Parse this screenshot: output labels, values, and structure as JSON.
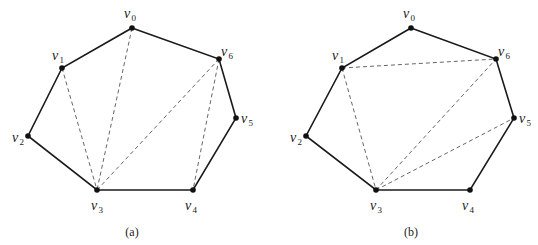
{
  "figures": [
    {
      "caption": "(a)",
      "vertices": [
        {
          "name": "v0",
          "label": "v",
          "sub": "0",
          "x": 132,
          "y": 28,
          "lx": -8,
          "ly": -10
        },
        {
          "name": "v1",
          "label": "v",
          "sub": "1",
          "x": 62,
          "y": 68,
          "lx": -10,
          "ly": -8
        },
        {
          "name": "v2",
          "label": "v",
          "sub": "2",
          "x": 28,
          "y": 136,
          "lx": -16,
          "ly": 6
        },
        {
          "name": "v3",
          "label": "v",
          "sub": "3",
          "x": 97,
          "y": 190,
          "lx": -6,
          "ly": 20
        },
        {
          "name": "v4",
          "label": "v",
          "sub": "4",
          "x": 193,
          "y": 190,
          "lx": -8,
          "ly": 20
        },
        {
          "name": "v5",
          "label": "v",
          "sub": "5",
          "x": 236,
          "y": 118,
          "lx": 5,
          "ly": 5
        },
        {
          "name": "v6",
          "label": "v",
          "sub": "6",
          "x": 219,
          "y": 59,
          "lx": 2,
          "ly": -3
        }
      ],
      "polygon": [
        "v0",
        "v6",
        "v5",
        "v4",
        "v3",
        "v2",
        "v1"
      ],
      "diagonals": [
        [
          "v1",
          "v3"
        ],
        [
          "v0",
          "v3"
        ],
        [
          "v6",
          "v3"
        ],
        [
          "v6",
          "v4"
        ]
      ],
      "caption_pos": {
        "x": 132,
        "y": 236
      }
    },
    {
      "caption": "(b)",
      "vertices": [
        {
          "name": "v0",
          "label": "v",
          "sub": "0",
          "x": 411,
          "y": 28,
          "lx": -8,
          "ly": -10
        },
        {
          "name": "v1",
          "label": "v",
          "sub": "1",
          "x": 342,
          "y": 68,
          "lx": -10,
          "ly": -8
        },
        {
          "name": "v2",
          "label": "v",
          "sub": "2",
          "x": 306,
          "y": 136,
          "lx": -16,
          "ly": 6
        },
        {
          "name": "v3",
          "label": "v",
          "sub": "3",
          "x": 376,
          "y": 190,
          "lx": -6,
          "ly": 20
        },
        {
          "name": "v4",
          "label": "v",
          "sub": "4",
          "x": 470,
          "y": 190,
          "lx": -8,
          "ly": 20
        },
        {
          "name": "v5",
          "label": "v",
          "sub": "5",
          "x": 514,
          "y": 118,
          "lx": 5,
          "ly": 5
        },
        {
          "name": "v6",
          "label": "v",
          "sub": "6",
          "x": 496,
          "y": 59,
          "lx": 2,
          "ly": -3
        }
      ],
      "polygon": [
        "v0",
        "v6",
        "v5",
        "v4",
        "v3",
        "v2",
        "v1"
      ],
      "diagonals": [
        [
          "v1",
          "v6"
        ],
        [
          "v1",
          "v3"
        ],
        [
          "v3",
          "v6"
        ],
        [
          "v3",
          "v5"
        ]
      ],
      "caption_pos": {
        "x": 411,
        "y": 236
      }
    }
  ]
}
